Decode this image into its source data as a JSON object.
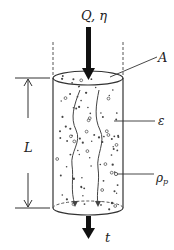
{
  "diagram": {
    "labels": {
      "flow": "Q,  η",
      "area": "A",
      "porosity": "ε",
      "particle_density": "ρ",
      "particle_density_sub": "p",
      "length": "L",
      "time": "t"
    },
    "colors": {
      "line": "#333333",
      "arrow": "#111111",
      "particle": "#444444"
    }
  }
}
